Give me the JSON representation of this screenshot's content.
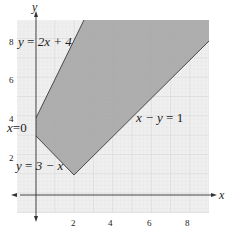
{
  "figure": {
    "type": "linear-programming-feasible-region",
    "axes": {
      "x_label": "x",
      "y_label": "y",
      "x_ticks": [
        "2",
        "4",
        "6",
        "8"
      ],
      "y_ticks": [
        "2",
        "4",
        "6",
        "8"
      ],
      "x_range": [
        -1,
        9
      ],
      "y_range": [
        -1,
        9
      ]
    },
    "lines": [
      {
        "id": "l1",
        "label_lhs": "y",
        "label_rhs": "2x + 4",
        "label": "y = 2x + 4"
      },
      {
        "id": "l2",
        "label_lhs": "x",
        "label_rhs": "0",
        "label": "x = 0"
      },
      {
        "id": "l3",
        "label_lhs": "y",
        "label_rhs": "3 − x",
        "label": "y = 3 − x"
      },
      {
        "id": "l4",
        "label_lhs": "x − y",
        "label_rhs": "1",
        "label": "x − y = 1"
      }
    ],
    "region": {
      "shaded": true,
      "fill_color": "#a9a9a9",
      "vertices": [
        [
          0,
          4
        ],
        [
          0,
          3
        ],
        [
          2,
          1
        ],
        [
          9,
          8
        ],
        [
          9,
          9
        ],
        [
          2.5,
          9
        ]
      ]
    },
    "grid_color": "#d4d4d4",
    "background_color": "#ececec"
  }
}
